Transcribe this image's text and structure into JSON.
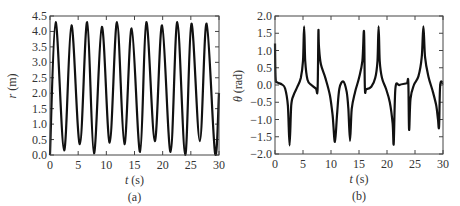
{
  "chart_data": [
    {
      "id": "a",
      "type": "line",
      "caption": "(a)",
      "title": "",
      "xlabel_var": "t",
      "xlabel_unit": " (s)",
      "ylabel_var": "r",
      "ylabel_unit": " (m)",
      "xlim": [
        0,
        30
      ],
      "ylim": [
        0,
        4.5
      ],
      "xticks": [
        0,
        5,
        10,
        15,
        20,
        25,
        30
      ],
      "xtick_labels": [
        "0",
        "5",
        "10",
        "15",
        "20",
        "25",
        "30"
      ],
      "yticks": [
        0,
        0.5,
        1.0,
        1.5,
        2.0,
        2.5,
        3.0,
        3.5,
        4.0,
        4.5
      ],
      "ytick_labels": [
        "0.0",
        "0.5",
        "1.0",
        "1.5",
        "2.0",
        "2.5",
        "3.0",
        "3.5",
        "4.0",
        "4.5"
      ],
      "grid": false,
      "series": [
        {
          "name": "r",
          "color": "#111111",
          "x": [
            0,
            1.0,
            2.5,
            3.8,
            5.3,
            6.6,
            7.8,
            9.2,
            10.6,
            11.9,
            13.2,
            14.5,
            16.0,
            17.1,
            18.6,
            19.9,
            21.4,
            22.6,
            24.0,
            25.1,
            26.6,
            27.8,
            29.3,
            30
          ],
          "values": [
            0.0,
            4.3,
            0.15,
            4.2,
            0.35,
            4.3,
            0.05,
            4.15,
            0.4,
            4.3,
            0.35,
            4.1,
            0.1,
            4.3,
            0.45,
            4.2,
            0.1,
            4.3,
            0.0,
            4.25,
            0.45,
            4.25,
            0.05,
            2.0
          ]
        }
      ]
    },
    {
      "id": "b",
      "type": "line",
      "caption": "(b)",
      "title": "",
      "xlabel_var": "t",
      "xlabel_unit": " (s)",
      "ylabel_var": "θ",
      "ylabel_unit": " (rad)",
      "xlim": [
        0,
        30
      ],
      "ylim": [
        -2.0,
        2.0
      ],
      "xticks": [
        0,
        5,
        10,
        15,
        20,
        25,
        30
      ],
      "xtick_labels": [
        "0",
        "5",
        "10",
        "15",
        "20",
        "25",
        "30"
      ],
      "yticks": [
        -2.0,
        -1.5,
        -1.0,
        -0.5,
        0.0,
        0.5,
        1.0,
        1.5,
        2.0
      ],
      "ytick_labels": [
        "−2.0",
        "−1.5",
        "−1.0",
        "−0.5",
        "0.0",
        "0.5",
        "1.0",
        "1.5",
        "2.0"
      ],
      "grid": false,
      "series": [
        {
          "name": "theta",
          "color": "#111111",
          "x": [
            0,
            0.1,
            0.4,
            1.2,
            1.8,
            2.3,
            2.6,
            2.9,
            3.3,
            4.0,
            4.6,
            5.0,
            5.2,
            5.4,
            5.8,
            6.5,
            7.3,
            7.6,
            7.75,
            7.85,
            8.2,
            9.0,
            9.8,
            10.3,
            10.7,
            11.1,
            11.5,
            12.2,
            12.8,
            13.1,
            13.4,
            13.7,
            14.3,
            15.0,
            15.6,
            15.9,
            16.05,
            16.3,
            17.2,
            17.9,
            18.3,
            18.5,
            18.7,
            19.1,
            19.8,
            20.5,
            21.0,
            21.2,
            21.5,
            22.2,
            23.5,
            23.8,
            23.95,
            24.2,
            24.8,
            25.6,
            26.2,
            26.5,
            26.8,
            27.4,
            28.2,
            28.8,
            29.1,
            29.3,
            29.5,
            30
          ],
          "values": [
            1.2,
            0.2,
            0.08,
            0.02,
            -0.1,
            -0.6,
            -1.75,
            -0.6,
            -0.3,
            -0.05,
            0.2,
            0.7,
            1.7,
            0.7,
            0.15,
            0.0,
            -0.1,
            -0.12,
            1.55,
            1.1,
            0.6,
            0.2,
            -0.3,
            -0.9,
            -1.65,
            -0.8,
            -0.1,
            0.1,
            -0.2,
            -0.7,
            -1.62,
            -0.7,
            -0.2,
            0.2,
            0.7,
            1.55,
            -0.1,
            -0.12,
            -0.05,
            0.2,
            0.7,
            1.7,
            0.7,
            0.2,
            -0.1,
            -0.5,
            -1.1,
            -1.7,
            -0.1,
            0.0,
            0.05,
            0.08,
            -1.3,
            -0.4,
            0.0,
            0.25,
            0.8,
            1.7,
            0.8,
            0.25,
            -0.2,
            -0.6,
            -1.0,
            -1.2,
            0.0,
            0.05
          ]
        }
      ]
    }
  ]
}
